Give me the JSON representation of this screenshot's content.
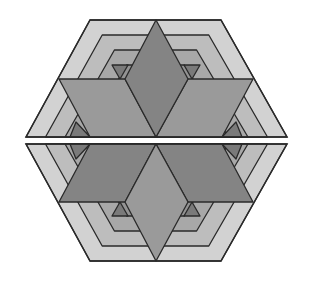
{
  "figure": {
    "colors": {
      "background": "#ffffff",
      "stroke": "#2a2a2a",
      "band_outer": "#d2d2d2",
      "band_2": "#bdbdbd",
      "band_3": "#a8a8a8",
      "band_4": "#939393",
      "inner_triangle": "#7a7a7a",
      "rhombus_top": "#848484",
      "parallelogram_top": "#9a9a9a",
      "rhombus_bottom": "#9a9a9a",
      "parallelogram_bottom": "#848484"
    },
    "halves": [
      "top",
      "bottom"
    ],
    "gap_px": 6
  }
}
